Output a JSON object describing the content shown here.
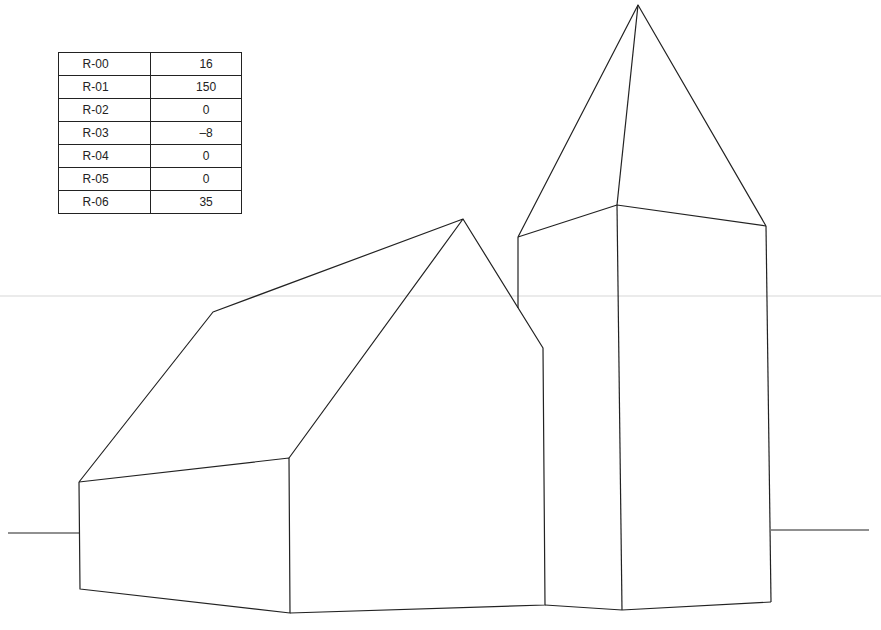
{
  "figure": {
    "line_color": "#222222",
    "horizon_color": "#d8d8d8"
  },
  "parameter_table": {
    "rows": [
      {
        "label": "R-00",
        "value": "16"
      },
      {
        "label": "R-01",
        "value": "150"
      },
      {
        "label": "R-02",
        "value": "0"
      },
      {
        "label": "R-03",
        "value": "–8"
      },
      {
        "label": "R-04",
        "value": "0"
      },
      {
        "label": "R-05",
        "value": "0"
      },
      {
        "label": "R-06",
        "value": "35"
      }
    ]
  }
}
